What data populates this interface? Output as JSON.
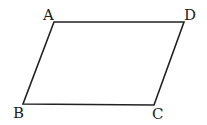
{
  "diagram": {
    "type": "parallelogram",
    "vertices": [
      {
        "label": "A"
      },
      {
        "label": "D"
      },
      {
        "label": "C"
      },
      {
        "label": "B"
      }
    ],
    "edges": [
      "AD",
      "DC",
      "CB",
      "BA"
    ],
    "stroke_color": "#222222"
  }
}
